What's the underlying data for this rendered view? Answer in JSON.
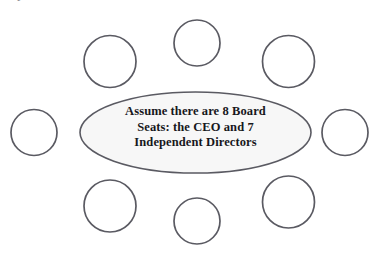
{
  "diagram": {
    "type": "boardroom-seating",
    "canvas": {
      "width": 389,
      "height": 266,
      "background": "#ffffff"
    },
    "clipped_caption_fragment": "F",
    "table": {
      "name": "board-table",
      "shape": "ellipse",
      "center_x": 195.5,
      "center_y": 132.5,
      "radius_x": 115.5,
      "radius_y": 40.5,
      "fill": "#f7f7f7",
      "stroke": "#5a5a62",
      "stroke_width": 1.6,
      "label_lines": [
        "Assume there are 8 Board",
        "Seats: the CEO and 7",
        "Independent Directors"
      ],
      "label_color": "#17171c"
    },
    "seats": {
      "count": 8,
      "stroke": "#5a5a62",
      "stroke_width": 1.7,
      "fill": "#ffffff",
      "items": [
        {
          "id": "seat-top-center",
          "position": "top-center",
          "cx": 197,
          "cy": 43,
          "r": 23
        },
        {
          "id": "seat-top-left",
          "position": "top-left",
          "cx": 110,
          "cy": 61.5,
          "r": 26
        },
        {
          "id": "seat-top-right",
          "position": "top-right",
          "cx": 288.5,
          "cy": 61.5,
          "r": 26
        },
        {
          "id": "seat-middle-left",
          "position": "middle-left",
          "cx": 34,
          "cy": 132.5,
          "r": 23
        },
        {
          "id": "seat-middle-right",
          "position": "middle-right",
          "cx": 345,
          "cy": 132.5,
          "r": 23
        },
        {
          "id": "seat-bottom-left",
          "position": "bottom-left",
          "cx": 110,
          "cy": 206,
          "r": 26
        },
        {
          "id": "seat-bottom-right",
          "position": "bottom-right",
          "cx": 288.5,
          "cy": 202,
          "r": 26
        },
        {
          "id": "seat-bottom-center",
          "position": "bottom-center",
          "cx": 197,
          "cy": 221,
          "r": 23
        }
      ]
    }
  }
}
